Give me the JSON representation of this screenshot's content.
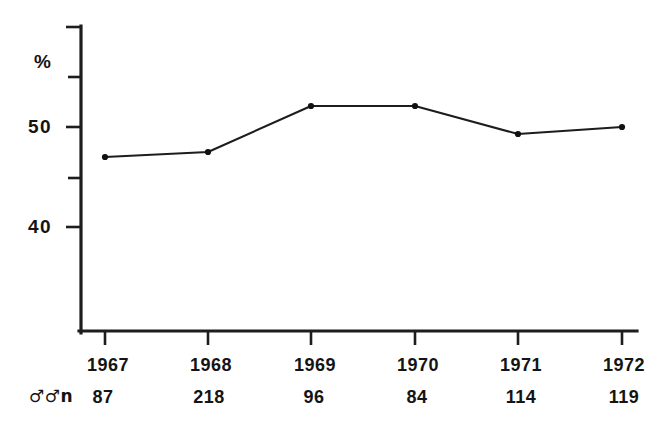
{
  "chart_data": {
    "type": "line",
    "title": "",
    "subtitle": "",
    "xlabel": "",
    "ylabel": "%",
    "categories": [
      "1967",
      "1968",
      "1969",
      "1970",
      "1971",
      "1972"
    ],
    "values": [
      47.0,
      47.5,
      52.1,
      52.1,
      49.3,
      50.0
    ],
    "series": [
      {
        "name": "",
        "values": [
          47.0,
          47.5,
          52.1,
          52.1,
          49.3,
          50.0
        ]
      }
    ],
    "ylim": [
      33.0,
      56.5
    ],
    "y_major_ticks": [
      50,
      40
    ],
    "y_major_tick_labels": [
      "50",
      "40"
    ],
    "y_minor_ticks": [
      55,
      45
    ],
    "grid": false,
    "legend": null,
    "legend_position": "none",
    "markers": "dot",
    "annotations": {
      "sample_row_label": "♂♂n",
      "sample_sizes": [
        "87",
        "218",
        "96",
        "84",
        "114",
        "119"
      ]
    }
  },
  "axes": {
    "y_unit_label": "%",
    "y_tick_labels": [
      "50",
      "40"
    ],
    "x_tick_labels": [
      "1967",
      "1968",
      "1969",
      "1970",
      "1971",
      "1972"
    ]
  },
  "sample_row": {
    "label": "♂♂n",
    "values": [
      "87",
      "218",
      "96",
      "84",
      "114",
      "119"
    ]
  },
  "colors": {
    "ink": "#1d1d1d",
    "background": "#ffffff",
    "marker": "#111111"
  }
}
